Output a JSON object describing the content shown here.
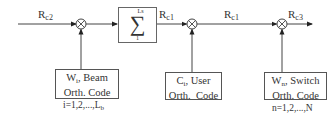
{
  "diagram": {
    "signals": {
      "input": {
        "base": "R",
        "sub": "c2"
      },
      "sum_output": {
        "base": "R",
        "sub": "c1"
      },
      "mid": {
        "base": "R",
        "sub": "c1"
      },
      "output": {
        "base": "R",
        "sub": "c3"
      }
    },
    "summation": {
      "symbol": "∑",
      "upper": "Ls",
      "lower": "1"
    },
    "multipliers": [
      {
        "id": "mult-1",
        "symbol": "⊗"
      },
      {
        "id": "mult-2",
        "symbol": "⊗"
      },
      {
        "id": "mult-3",
        "symbol": "⊗"
      }
    ],
    "code_blocks": {
      "beam": {
        "var": "W",
        "sub": "i",
        "name": ", Beam",
        "line2": "Orth. Code",
        "index_prefix": "i=1,2,...,L",
        "index_sub": "b"
      },
      "user": {
        "var": "C",
        "sub": "i",
        "name": ", User",
        "line2": "Orth.  Code"
      },
      "switch": {
        "var": "W",
        "sub": "n",
        "name": ", Switch",
        "line2": "Orth. Code",
        "index": "n=1,2,...,N"
      }
    },
    "colors": {
      "line": "#333333",
      "box_border": "#555555"
    }
  }
}
